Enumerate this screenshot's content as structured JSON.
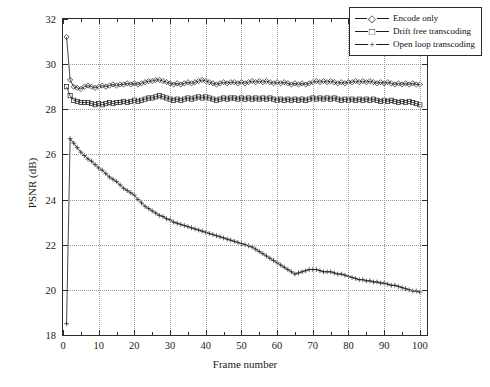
{
  "chart_data": {
    "type": "line",
    "title": "",
    "xlabel": "Frame number",
    "ylabel": "PSNR (dB)",
    "xlim": [
      0,
      102
    ],
    "ylim": [
      18,
      32
    ],
    "xticks": [
      0,
      10,
      20,
      30,
      40,
      50,
      60,
      70,
      80,
      90,
      100
    ],
    "yticks": [
      18,
      20,
      22,
      24,
      26,
      28,
      30,
      32
    ],
    "grid": true,
    "legend_position": "top-right",
    "x": [
      1,
      2,
      3,
      4,
      5,
      6,
      7,
      8,
      9,
      10,
      11,
      12,
      13,
      14,
      15,
      16,
      17,
      18,
      19,
      20,
      21,
      22,
      23,
      24,
      25,
      26,
      27,
      28,
      29,
      30,
      31,
      32,
      33,
      34,
      35,
      36,
      37,
      38,
      39,
      40,
      41,
      42,
      43,
      44,
      45,
      46,
      47,
      48,
      49,
      50,
      51,
      52,
      53,
      54,
      55,
      56,
      57,
      58,
      59,
      60,
      61,
      62,
      63,
      64,
      65,
      66,
      67,
      68,
      69,
      70,
      71,
      72,
      73,
      74,
      75,
      76,
      77,
      78,
      79,
      80,
      81,
      82,
      83,
      84,
      85,
      86,
      87,
      88,
      89,
      90,
      91,
      92,
      93,
      94,
      95,
      96,
      97,
      98,
      99,
      100
    ],
    "series": [
      {
        "name": "Encode only",
        "marker": "diamond",
        "values": [
          31.2,
          29.3,
          29.0,
          28.95,
          28.9,
          29.0,
          29.05,
          29.0,
          28.95,
          29.0,
          29.05,
          29.0,
          29.05,
          29.1,
          29.05,
          29.1,
          29.1,
          29.15,
          29.1,
          29.15,
          29.1,
          29.15,
          29.2,
          29.25,
          29.25,
          29.3,
          29.3,
          29.25,
          29.2,
          29.15,
          29.1,
          29.15,
          29.1,
          29.15,
          29.2,
          29.15,
          29.2,
          29.25,
          29.3,
          29.25,
          29.2,
          29.15,
          29.1,
          29.15,
          29.2,
          29.15,
          29.2,
          29.2,
          29.15,
          29.2,
          29.15,
          29.2,
          29.25,
          29.2,
          29.25,
          29.2,
          29.25,
          29.2,
          29.15,
          29.2,
          29.15,
          29.2,
          29.15,
          29.1,
          29.15,
          29.1,
          29.15,
          29.1,
          29.15,
          29.2,
          29.25,
          29.2,
          29.25,
          29.2,
          29.25,
          29.2,
          29.15,
          29.2,
          29.15,
          29.2,
          29.2,
          29.25,
          29.2,
          29.25,
          29.2,
          29.25,
          29.2,
          29.15,
          29.2,
          29.15,
          29.2,
          29.15,
          29.1,
          29.15,
          29.1,
          29.15,
          29.1,
          29.15,
          29.1,
          29.1
        ]
      },
      {
        "name": "Drift free transcoding",
        "marker": "square",
        "values": [
          29.0,
          28.6,
          28.4,
          28.35,
          28.3,
          28.3,
          28.3,
          28.25,
          28.2,
          28.25,
          28.2,
          28.25,
          28.3,
          28.25,
          28.3,
          28.3,
          28.35,
          28.3,
          28.35,
          28.4,
          28.35,
          28.4,
          28.45,
          28.5,
          28.5,
          28.55,
          28.6,
          28.55,
          28.5,
          28.45,
          28.4,
          28.45,
          28.4,
          28.45,
          28.5,
          28.45,
          28.5,
          28.55,
          28.5,
          28.55,
          28.5,
          28.45,
          28.4,
          28.45,
          28.5,
          28.45,
          28.5,
          28.5,
          28.45,
          28.5,
          28.45,
          28.5,
          28.45,
          28.5,
          28.45,
          28.5,
          28.45,
          28.5,
          28.45,
          28.4,
          28.45,
          28.4,
          28.45,
          28.4,
          28.45,
          28.4,
          28.45,
          28.4,
          28.45,
          28.5,
          28.45,
          28.5,
          28.45,
          28.5,
          28.45,
          28.5,
          28.45,
          28.4,
          28.45,
          28.4,
          28.45,
          28.4,
          28.45,
          28.4,
          28.45,
          28.4,
          28.45,
          28.4,
          28.35,
          28.4,
          28.35,
          28.4,
          28.35,
          28.3,
          28.35,
          28.3,
          28.35,
          28.3,
          28.25,
          28.2
        ]
      },
      {
        "name": "Open loop transcoding",
        "marker": "plus",
        "values": [
          18.5,
          26.7,
          26.5,
          26.3,
          26.1,
          25.95,
          25.8,
          25.7,
          25.55,
          25.4,
          25.3,
          25.15,
          25.0,
          24.9,
          24.8,
          24.65,
          24.5,
          24.4,
          24.3,
          24.2,
          24.0,
          23.85,
          23.7,
          23.6,
          23.5,
          23.4,
          23.3,
          23.25,
          23.15,
          23.1,
          23.0,
          22.95,
          22.9,
          22.85,
          22.8,
          22.75,
          22.7,
          22.65,
          22.6,
          22.55,
          22.5,
          22.45,
          22.4,
          22.35,
          22.3,
          22.25,
          22.2,
          22.15,
          22.1,
          22.05,
          22.0,
          21.95,
          21.9,
          21.8,
          21.7,
          21.6,
          21.5,
          21.4,
          21.3,
          21.2,
          21.1,
          21.0,
          20.9,
          20.8,
          20.7,
          20.75,
          20.8,
          20.85,
          20.9,
          20.9,
          20.9,
          20.85,
          20.8,
          20.8,
          20.8,
          20.75,
          20.7,
          20.7,
          20.65,
          20.6,
          20.55,
          20.5,
          20.45,
          20.45,
          20.4,
          20.4,
          20.35,
          20.35,
          20.3,
          20.3,
          20.25,
          20.2,
          20.2,
          20.15,
          20.1,
          20.05,
          20.0,
          19.95,
          19.95,
          19.9
        ]
      }
    ]
  },
  "legend": {
    "items": [
      {
        "label": "Encode only",
        "marker": "diamond"
      },
      {
        "label": "Drift free transcoding",
        "marker": "square"
      },
      {
        "label": "Open loop transcoding",
        "marker": "plus"
      }
    ]
  },
  "axis": {
    "x_title": "Frame number",
    "y_title": "PSNR (dB)",
    "x_tick_labels": [
      "0",
      "10",
      "20",
      "30",
      "40",
      "50",
      "60",
      "70",
      "80",
      "90",
      "100"
    ],
    "y_tick_labels": [
      "18",
      "20",
      "22",
      "24",
      "26",
      "28",
      "30",
      "32"
    ]
  },
  "colors": {
    "axis": "#2b2b2b",
    "grid": "#9a9a9a",
    "series": "#1a1a1a",
    "background": "#ffffff"
  }
}
